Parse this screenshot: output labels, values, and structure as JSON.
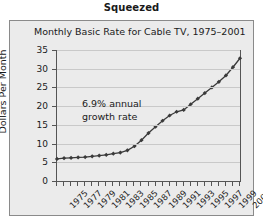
{
  "figure": {
    "caption": "Squeezed"
  },
  "chart_data": {
    "type": "line",
    "title": "Monthly Basic Rate for Cable TV, 1975–2001",
    "xlabel": "",
    "ylabel": "Dollars Per Month",
    "ylim": [
      0,
      35
    ],
    "ytick_values": [
      0,
      5,
      10,
      15,
      20,
      25,
      30,
      35
    ],
    "ytick_labels": [
      "0",
      "5",
      "10",
      "15",
      "20",
      "25",
      "30",
      "35"
    ],
    "xlim": [
      1975,
      2001
    ],
    "xtick_labels": [
      "1975",
      "1977",
      "1979",
      "1981",
      "1983",
      "1985",
      "1987",
      "1989",
      "1991",
      "1993",
      "1995",
      "1997",
      "1999",
      "2001"
    ],
    "xtick_label_years": [
      1975,
      1977,
      1979,
      1981,
      1983,
      1985,
      1987,
      1989,
      1991,
      1993,
      1995,
      1997,
      1999,
      2001
    ],
    "x": [
      1975,
      1976,
      1977,
      1978,
      1979,
      1980,
      1981,
      1982,
      1983,
      1984,
      1985,
      1986,
      1987,
      1988,
      1989,
      1990,
      1991,
      1992,
      1993,
      1994,
      1995,
      1996,
      1997,
      1998,
      1999,
      2000,
      2001
    ],
    "values": [
      5.9,
      6.1,
      6.2,
      6.3,
      6.4,
      6.6,
      6.8,
      7.0,
      7.3,
      7.6,
      8.2,
      9.3,
      10.9,
      12.8,
      14.5,
      16.1,
      17.5,
      18.5,
      19.0,
      20.5,
      22.0,
      23.5,
      25.0,
      26.5,
      28.2,
      30.4,
      32.8
    ],
    "series": [
      {
        "name": "Monthly basic rate",
        "values": [
          5.9,
          6.1,
          6.2,
          6.3,
          6.4,
          6.6,
          6.8,
          7.0,
          7.3,
          7.6,
          8.2,
          9.3,
          10.9,
          12.8,
          14.5,
          16.1,
          17.5,
          18.5,
          19.0,
          20.5,
          22.0,
          23.5,
          25.0,
          26.5,
          28.2,
          30.4,
          32.8
        ]
      }
    ],
    "annotations": [
      {
        "line1": "6.9% annual",
        "line2": "growth rate"
      }
    ],
    "grid": true,
    "legend": "none",
    "marker": "diamond",
    "line_color": "#3a3a3a",
    "grid_color": "#c9c9c9",
    "plot_background": "#ebebeb"
  }
}
